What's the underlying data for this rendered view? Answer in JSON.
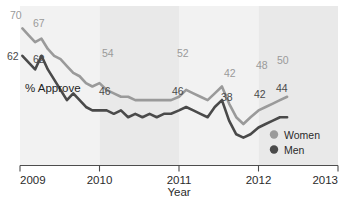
{
  "chart_data": {
    "type": "line",
    "title": "",
    "subtitle": "",
    "xlabel": "Year",
    "ylabel": "% Approve",
    "xlim": [
      2009.0,
      2013.0
    ],
    "ylim": [
      30,
      76
    ],
    "grid": false,
    "legend_position": "bottom-right",
    "x_tick_labels": [
      "2009",
      "2010",
      "2011",
      "2012",
      "2013"
    ],
    "x_tick_values": [
      2009,
      2010,
      2011,
      2012,
      2013
    ],
    "background_bands": [
      {
        "from": 2009.0,
        "to": 2010.0,
        "shade": "#f2f2f2"
      },
      {
        "from": 2010.0,
        "to": 2011.0,
        "shade": "#e9e9e9"
      },
      {
        "from": 2011.0,
        "to": 2012.0,
        "shade": "#f2f2f2"
      },
      {
        "from": 2012.0,
        "to": 2013.0,
        "shade": "#e9e9e9"
      }
    ],
    "series": [
      {
        "name": "Women",
        "color": "#9a9a9a",
        "x": [
          2009.03,
          2009.11,
          2009.19,
          2009.27,
          2009.35,
          2009.43,
          2009.51,
          2009.59,
          2009.67,
          2009.75,
          2009.83,
          2009.91,
          2010.0,
          2010.09,
          2010.18,
          2010.27,
          2010.36,
          2010.45,
          2010.54,
          2010.63,
          2010.72,
          2010.81,
          2010.9,
          2011.0,
          2011.09,
          2011.18,
          2011.27,
          2011.36,
          2011.45,
          2011.54,
          2011.63,
          2011.72,
          2011.81,
          2011.9,
          2012.0,
          2012.09,
          2012.18,
          2012.27,
          2012.36
        ],
        "values": [
          70,
          68,
          66,
          67,
          64,
          62,
          61,
          59,
          57,
          56,
          54,
          53,
          54,
          52,
          51,
          50,
          50,
          49,
          49,
          49,
          49,
          49,
          49,
          50,
          52,
          51,
          50,
          49,
          51,
          53,
          48,
          44,
          42,
          44,
          46,
          47,
          48,
          49,
          50
        ]
      },
      {
        "name": "Men",
        "color": "#4a4a4a",
        "x": [
          2009.03,
          2009.11,
          2009.19,
          2009.27,
          2009.35,
          2009.43,
          2009.51,
          2009.59,
          2009.67,
          2009.75,
          2009.83,
          2009.91,
          2010.0,
          2010.09,
          2010.18,
          2010.27,
          2010.36,
          2010.45,
          2010.54,
          2010.63,
          2010.72,
          2010.81,
          2010.9,
          2011.0,
          2011.09,
          2011.18,
          2011.27,
          2011.36,
          2011.45,
          2011.54,
          2011.63,
          2011.72,
          2011.81,
          2011.9,
          2012.0,
          2012.09,
          2012.18,
          2012.27,
          2012.36
        ],
        "values": [
          62,
          60,
          58,
          62,
          58,
          55,
          52,
          49,
          51,
          49,
          47,
          46,
          46,
          46,
          45,
          46,
          44,
          45,
          44,
          45,
          44,
          45,
          45,
          46,
          47,
          46,
          45,
          44,
          47,
          49,
          43,
          39,
          38,
          39,
          41,
          42,
          43,
          44,
          44
        ]
      }
    ],
    "annotations": [
      {
        "text": "70",
        "series": "Women",
        "x": 2009.03,
        "px": 10,
        "py": 19
      },
      {
        "text": "67",
        "series": "Women",
        "x": 2009.27,
        "px": 33,
        "py": 27
      },
      {
        "text": "54",
        "series": "Women",
        "x": 2010.0,
        "px": 102,
        "py": 57
      },
      {
        "text": "52",
        "series": "Women",
        "x": 2011.09,
        "px": 177,
        "py": 57
      },
      {
        "text": "42",
        "series": "Women",
        "x": 2011.81,
        "px": 224,
        "py": 77
      },
      {
        "text": "48",
        "series": "Women",
        "x": 2012.18,
        "px": 256,
        "py": 69
      },
      {
        "text": "50",
        "series": "Women",
        "x": 2012.36,
        "px": 277,
        "py": 64
      },
      {
        "text": "62",
        "series": "Men",
        "x": 2009.03,
        "px": 7,
        "py": 60
      },
      {
        "text": "62",
        "series": "Men",
        "x": 2009.27,
        "px": 33,
        "py": 63
      },
      {
        "text": "46",
        "series": "Men",
        "x": 2010.0,
        "px": 99,
        "py": 95
      },
      {
        "text": "46",
        "series": "Men",
        "x": 2011.0,
        "px": 172,
        "py": 95
      },
      {
        "text": "38",
        "series": "Men",
        "x": 2011.81,
        "px": 221,
        "py": 101
      },
      {
        "text": "42",
        "series": "Men",
        "x": 2012.18,
        "px": 254,
        "py": 98
      },
      {
        "text": "44",
        "series": "Men",
        "x": 2012.36,
        "px": 276,
        "py": 92
      }
    ],
    "legend": [
      {
        "label": "Women",
        "color": "#9a9a9a"
      },
      {
        "label": "Men",
        "color": "#4a4a4a"
      }
    ]
  }
}
